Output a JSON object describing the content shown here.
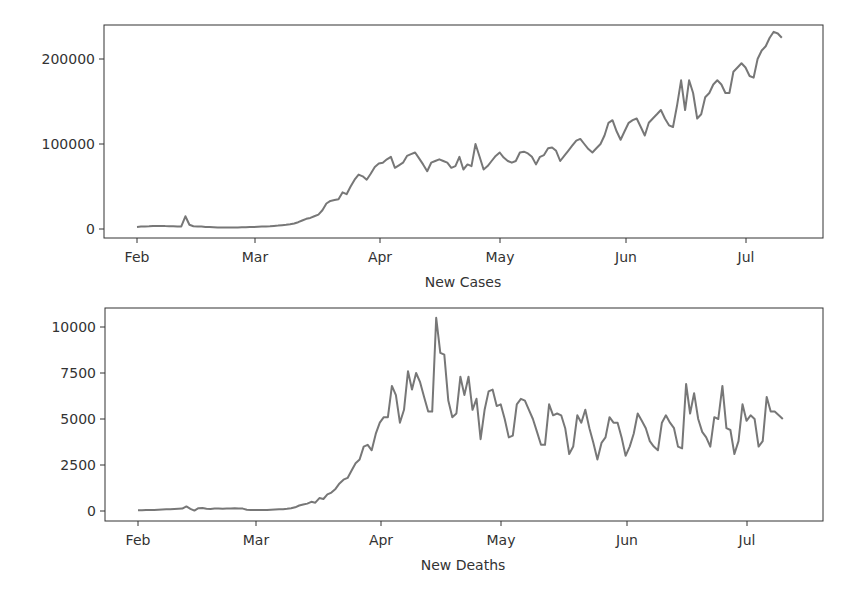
{
  "chart_data": [
    {
      "type": "line",
      "title": "",
      "xlabel": "New Cases",
      "ylabel": "",
      "x_tick_labels": [
        "Feb",
        "Mar",
        "Apr",
        "May",
        "Jun",
        "Jul"
      ],
      "y_tick_labels": [
        "0",
        "100000",
        "200000"
      ],
      "y_ticks": [
        0,
        100000,
        200000
      ],
      "ylim": [
        -12000,
        242000
      ],
      "grid": false,
      "line_color": "#777777",
      "x_start": "Feb 1",
      "x_step": "1 day",
      "series": [
        {
          "name": "New Cases",
          "values": [
            2500,
            2800,
            3000,
            3200,
            3500,
            3700,
            3600,
            3400,
            3300,
            3200,
            3100,
            3000,
            15000,
            5000,
            3200,
            3000,
            2800,
            2500,
            2200,
            2000,
            1800,
            1800,
            1700,
            1700,
            1800,
            1900,
            2000,
            2100,
            2200,
            2400,
            2600,
            2800,
            3000,
            3300,
            3600,
            4000,
            4500,
            5000,
            5500,
            6500,
            8000,
            10000,
            12000,
            13000,
            15000,
            17000,
            22000,
            30000,
            33000,
            34000,
            35000,
            43000,
            41000,
            50000,
            58000,
            64000,
            62000,
            58000,
            65000,
            73000,
            77000,
            78000,
            82000,
            85000,
            72000,
            75000,
            78000,
            86000,
            88000,
            90000,
            83000,
            76000,
            68000,
            78000,
            80000,
            82000,
            80000,
            78000,
            72000,
            74000,
            85000,
            70000,
            76000,
            74000,
            100000,
            85000,
            70000,
            74000,
            80000,
            86000,
            90000,
            84000,
            80000,
            78000,
            80000,
            90000,
            91000,
            89000,
            85000,
            76000,
            85000,
            87000,
            95000,
            96000,
            92000,
            80000,
            86000,
            92000,
            98000,
            104000,
            106000,
            100000,
            94000,
            90000,
            95000,
            100000,
            110000,
            125000,
            128000,
            115000,
            105000,
            115000,
            125000,
            128000,
            130000,
            120000,
            110000,
            125000,
            130000,
            135000,
            140000,
            130000,
            122000,
            120000,
            145000,
            175000,
            140000,
            175000,
            160000,
            130000,
            135000,
            155000,
            160000,
            170000,
            175000,
            170000,
            160000,
            160000,
            185000,
            190000,
            195000,
            190000,
            180000,
            178000,
            200000,
            210000,
            215000,
            225000,
            232000,
            230000,
            225000
          ]
        }
      ]
    },
    {
      "type": "line",
      "title": "",
      "xlabel": "New Deaths",
      "ylabel": "",
      "x_tick_labels": [
        "Feb",
        "Mar",
        "Apr",
        "May",
        "Jun",
        "Jul"
      ],
      "y_tick_labels": [
        "0",
        "2500",
        "5000",
        "7500",
        "10000"
      ],
      "y_ticks": [
        0,
        2500,
        5000,
        7500,
        10000
      ],
      "ylim": [
        -550,
        11000
      ],
      "grid": false,
      "line_color": "#777777",
      "x_start": "Feb 1",
      "x_step": "1 day",
      "series": [
        {
          "name": "New Deaths",
          "values": [
            40,
            45,
            50,
            55,
            60,
            70,
            80,
            90,
            100,
            110,
            120,
            130,
            250,
            120,
            20,
            150,
            160,
            120,
            110,
            130,
            140,
            120,
            130,
            140,
            150,
            140,
            130,
            70,
            60,
            50,
            50,
            60,
            60,
            70,
            80,
            90,
            100,
            120,
            150,
            200,
            300,
            350,
            400,
            500,
            450,
            700,
            650,
            900,
            1000,
            1200,
            1500,
            1700,
            1800,
            2200,
            2600,
            2800,
            3500,
            3600,
            3300,
            4200,
            4800,
            5100,
            5100,
            6800,
            6300,
            4800,
            5500,
            7600,
            6600,
            7500,
            7000,
            6200,
            5400,
            5400,
            10500,
            8600,
            8500,
            6000,
            5100,
            5300,
            7300,
            6300,
            7300,
            5500,
            6100,
            3900,
            5500,
            6500,
            6600,
            5700,
            5800,
            5000,
            4000,
            4100,
            5800,
            6100,
            6000,
            5500,
            5000,
            4300,
            3600,
            3600,
            5800,
            5200,
            5300,
            5200,
            4500,
            3100,
            3500,
            5200,
            4800,
            5500,
            4500,
            3700,
            2800,
            3700,
            4000,
            5100,
            4800,
            4800,
            4000,
            3000,
            3500,
            4200,
            5300,
            4900,
            4500,
            3800,
            3500,
            3300,
            4800,
            5200,
            4800,
            4500,
            3500,
            3400,
            6900,
            5300,
            6400,
            5000,
            4300,
            4000,
            3500,
            5100,
            5000,
            6800,
            4500,
            4400,
            3100,
            3800,
            5800,
            4900,
            5200,
            5000,
            3500,
            3800,
            6200,
            5400,
            5400,
            5200,
            5000
          ]
        }
      ]
    }
  ],
  "axes": {
    "top": {
      "xlabel": "New Cases",
      "x_ticks": [
        "Feb",
        "Mar",
        "Apr",
        "May",
        "Jun",
        "Jul"
      ],
      "y_ticks": [
        "0",
        "100000",
        "200000"
      ]
    },
    "bottom": {
      "xlabel": "New Deaths",
      "x_ticks": [
        "Feb",
        "Mar",
        "Apr",
        "May",
        "Jun",
        "Jul"
      ],
      "y_ticks": [
        "0",
        "2500",
        "5000",
        "7500",
        "10000"
      ]
    }
  },
  "colors": {
    "line": "#777777",
    "axis": "#333333",
    "text": "#333333",
    "background": "#ffffff"
  }
}
